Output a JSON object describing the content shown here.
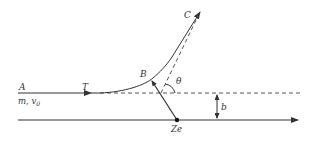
{
  "diagram": {
    "colors": {
      "stroke": "#333333",
      "background": "#ffffff"
    },
    "labels": {
      "A": "A",
      "mass_velocity": "m, v",
      "velocity_sub": "0",
      "T": "T",
      "B": "B",
      "C": "C",
      "theta": "θ",
      "b": "b",
      "Ze": "Ze"
    }
  }
}
